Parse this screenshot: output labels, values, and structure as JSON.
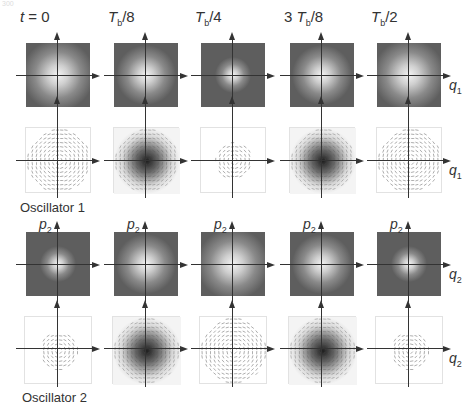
{
  "page_number": "300",
  "figure": {
    "time_labels": [
      {
        "prefix": "",
        "var": "t",
        "sub": "",
        "suffix": " = 0"
      },
      {
        "prefix": "",
        "var": "T",
        "sub": "b",
        "suffix": "/8"
      },
      {
        "prefix": "",
        "var": "T",
        "sub": "b",
        "suffix": "/4"
      },
      {
        "prefix": "3 ",
        "var": "T",
        "sub": "b",
        "suffix": "/8"
      },
      {
        "prefix": "",
        "var": "T",
        "sub": "b",
        "suffix": "/2"
      }
    ],
    "oscillator1": {
      "label": "Oscillator 1",
      "axis_x": {
        "var": "q",
        "sub": "1"
      },
      "wigner_blob_widths": [
        0.9,
        0.75,
        0.45,
        0.75,
        0.9
      ],
      "flow_density": [
        "wide-light",
        "dark-center",
        "small-light",
        "dark-center",
        "wide-light"
      ]
    },
    "oscillator2": {
      "label": "Oscillator 2",
      "axis_x": {
        "var": "q",
        "sub": "2"
      },
      "axis_y": {
        "var": "p",
        "sub": "2"
      },
      "wigner_blob_widths": [
        0.45,
        0.75,
        0.9,
        0.75,
        0.45
      ],
      "flow_density": [
        "small-light",
        "dark-center",
        "wide-light",
        "dark-center",
        "small-light"
      ]
    }
  },
  "colors": {
    "square_bg": "#5e5e5e",
    "blob_center": "#f4f4f4",
    "axis": "#333333",
    "flow_dark": "#1e1e1e"
  }
}
